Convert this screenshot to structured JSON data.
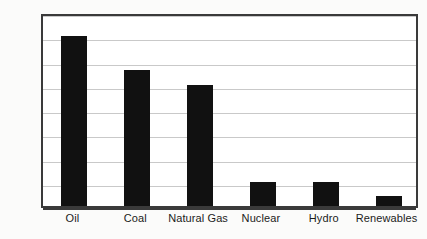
{
  "chart_data": {
    "type": "bar",
    "title": "",
    "subtitle": "",
    "xlabel": "",
    "ylabel": "",
    "categories": [
      "Oil",
      "Coal",
      "Natural Gas",
      "Nuclear",
      "Hydro",
      "Renewables"
    ],
    "values": [
      35,
      28,
      25,
      5,
      5,
      2
    ],
    "value_unit": "%",
    "ylim": [
      0,
      40
    ],
    "ytick_step": 5,
    "ytick_labels": [
      "0%",
      "5%",
      "10%",
      "15%",
      "20%",
      "25%",
      "30%",
      "35%",
      "40%"
    ],
    "ytick_values": [
      0,
      5,
      10,
      15,
      20,
      25,
      30,
      35,
      40
    ],
    "grid": true,
    "grid_axis": "y",
    "legend": false,
    "legend_position": "none",
    "bar_color": "#111111",
    "grid_color": "#c9c9c9",
    "axis_color": "#3a3a3a",
    "plot_background": "#ffffff",
    "figure_background": "#fbfbfa"
  }
}
